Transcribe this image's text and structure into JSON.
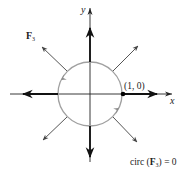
{
  "figure": {
    "field_label": "F",
    "field_subscript": "3",
    "x_axis_label": "x",
    "y_axis_label": "y",
    "point_label": "(1, 0)",
    "caption_prefix": "circ (",
    "caption_field": "F",
    "caption_subscript": "3",
    "caption_suffix": ") = 0",
    "colors": {
      "axis": "#111111",
      "circle": "#999999",
      "vector": "#555555",
      "point": "#000000"
    },
    "circle": {
      "center": [
        90,
        94
      ],
      "radius": 32,
      "orientation": "counterclockwise"
    },
    "vectors": [
      {
        "name": "east",
        "from": [
          123,
          94
        ],
        "to": [
          158,
          94
        ]
      },
      {
        "name": "west",
        "from": [
          58,
          94
        ],
        "to": [
          22,
          94
        ]
      },
      {
        "name": "north",
        "from": [
          90,
          62
        ],
        "to": [
          90,
          13
        ]
      },
      {
        "name": "south",
        "from": [
          90,
          126
        ],
        "to": [
          90,
          158
        ]
      },
      {
        "name": "northeast",
        "from": [
          113,
          71
        ],
        "to": [
          138,
          46
        ]
      },
      {
        "name": "northwest",
        "from": [
          67,
          71
        ],
        "to": [
          42,
          47
        ]
      },
      {
        "name": "southwest",
        "from": [
          67,
          117
        ],
        "to": [
          43,
          140
        ]
      },
      {
        "name": "southeast",
        "from": [
          113,
          117
        ],
        "to": [
          137,
          142
        ]
      }
    ]
  }
}
